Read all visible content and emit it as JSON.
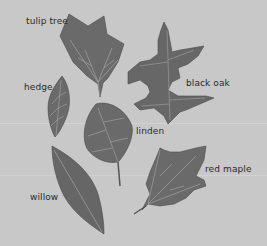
{
  "figure": {
    "title": "",
    "background_color": "#c8c8c8",
    "leaf_color": "#6b6b6b",
    "vein_color": "#a8a8a8"
  },
  "leaves": [
    {
      "id": "tulip-tree",
      "label": "tulip tree"
    },
    {
      "id": "black-oak",
      "label": "black oak"
    },
    {
      "id": "hedge",
      "label": "hedge"
    },
    {
      "id": "linden",
      "label": "linden"
    },
    {
      "id": "willow",
      "label": "willow"
    },
    {
      "id": "red-maple",
      "label": "red maple"
    }
  ]
}
